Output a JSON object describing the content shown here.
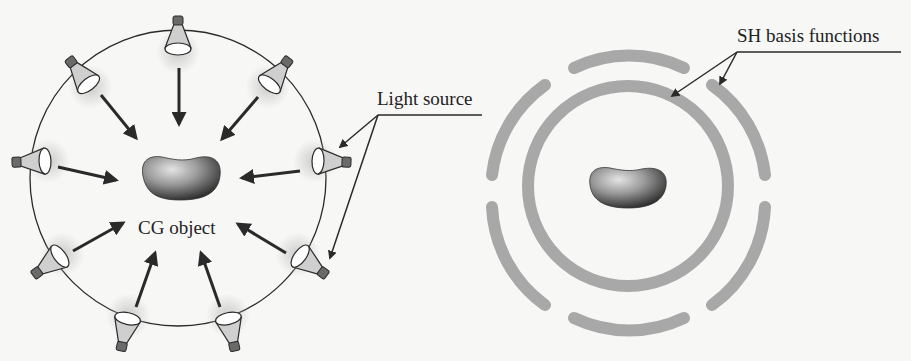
{
  "figure": {
    "left_panel": {
      "title": "Light sources illuminating a CG object",
      "object_label": "CG object",
      "callout_label": "Light source",
      "light_count": 10
    },
    "right_panel": {
      "title": "SH basis functions around a CG object",
      "callout_label": "SH basis functions"
    }
  },
  "colors": {
    "background": "#f7f7f5",
    "line": "#2a2a2a",
    "ring": "#a8a8a8",
    "bulb_fill": "#cfcfcf",
    "object_dark": "#2e2e2e",
    "object_light": "#d8d8d8"
  }
}
